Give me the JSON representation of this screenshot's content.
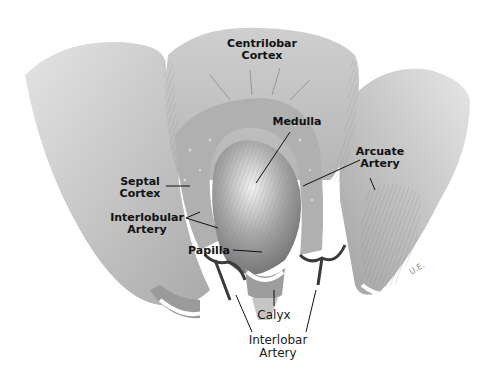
{
  "figure": {
    "signature": "U.E."
  },
  "labels": {
    "centrilobar_cortex": {
      "line1": "Centrilobar",
      "line2": "Cortex"
    },
    "medulla": "Medulla",
    "arcuate_artery": {
      "line1": "Arcuate",
      "line2": "Artery"
    },
    "septal_cortex": {
      "line1": "Septal",
      "line2": "Cortex"
    },
    "interlobular_artery": {
      "line1": "Interlobular",
      "line2": "Artery"
    },
    "papilla": "Papilla",
    "calyx": "Calyx",
    "interlobar_artery": {
      "line1": "Interlobar",
      "line2": "Artery"
    }
  },
  "colors": {
    "tissue_light": "#d6d6d6",
    "tissue_mid": "#bdbdbd",
    "tissue_dark": "#8f8f8f",
    "vessel": "#3a3a3a",
    "leader_line": "#111111",
    "background": "#ffffff"
  }
}
